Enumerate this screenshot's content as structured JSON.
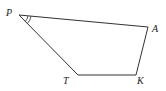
{
  "diagram": {
    "type": "quadrilateral",
    "vertices": [
      {
        "id": "P",
        "label": "P"
      },
      {
        "id": "A",
        "label": "A"
      },
      {
        "id": "K",
        "label": "K"
      },
      {
        "id": "T",
        "label": "T"
      }
    ],
    "edges": [
      {
        "from": "P",
        "to": "A"
      },
      {
        "from": "A",
        "to": "K"
      },
      {
        "from": "K",
        "to": "T"
      },
      {
        "from": "T",
        "to": "P"
      }
    ],
    "angle_marks": [
      {
        "vertex": "P",
        "style": "double-arc"
      }
    ],
    "colors": {
      "stroke": "#333333",
      "text": "#222222",
      "background": "#ffffff"
    }
  }
}
